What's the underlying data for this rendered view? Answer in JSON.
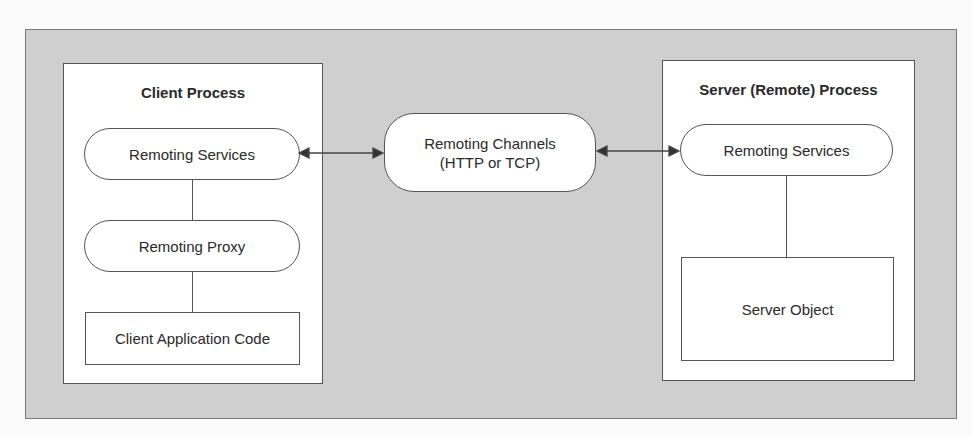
{
  "client_process": {
    "title": "Client Process",
    "remoting_services": "Remoting Services",
    "remoting_proxy": "Remoting Proxy",
    "client_code": "Client Application Code"
  },
  "channel": {
    "line1": "Remoting Channels",
    "line2": "(HTTP or TCP)"
  },
  "server_process": {
    "title": "Server (Remote) Process",
    "remoting_services": "Remoting Services",
    "server_object": "Server Object"
  }
}
